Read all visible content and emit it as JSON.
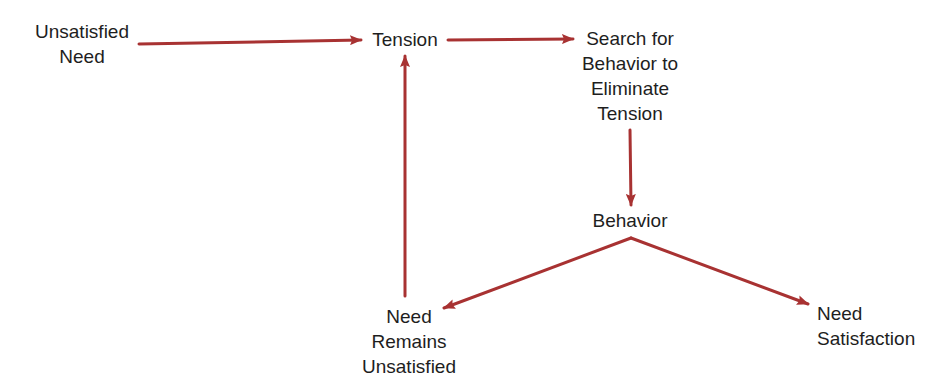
{
  "diagram": {
    "arrow_color": "#a83232",
    "text_color": "#1e1e1e",
    "nodes": {
      "unsatisfied_need": {
        "lines": [
          "Unsatisfied",
          "Need"
        ]
      },
      "tension": {
        "lines": [
          "Tension"
        ]
      },
      "search": {
        "lines": [
          "Search for",
          "Behavior to",
          "Eliminate",
          "Tension"
        ]
      },
      "behavior": {
        "lines": [
          "Behavior"
        ]
      },
      "need_remains": {
        "lines": [
          "Need",
          "Remains",
          "Unsatisfied"
        ]
      },
      "need_satisfaction": {
        "lines": [
          "Need",
          "Satisfaction"
        ]
      }
    },
    "edges": [
      {
        "from": "Unsatisfied Need",
        "to": "Tension"
      },
      {
        "from": "Tension",
        "to": "Search for Behavior to Eliminate Tension"
      },
      {
        "from": "Search for Behavior to Eliminate Tension",
        "to": "Behavior"
      },
      {
        "from": "Behavior",
        "to": "Need Remains Unsatisfied"
      },
      {
        "from": "Behavior",
        "to": "Need Satisfaction"
      },
      {
        "from": "Need Remains Unsatisfied",
        "to": "Tension"
      }
    ]
  }
}
